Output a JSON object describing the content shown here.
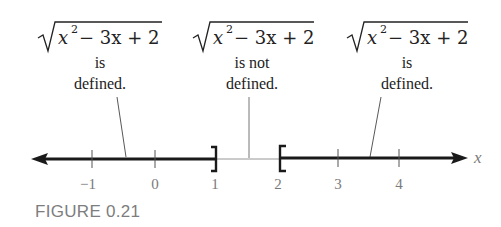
{
  "figure": {
    "caption": "FIGURE 0.21",
    "axis_variable": "x",
    "expression": {
      "radical": "√",
      "base": "x",
      "exponent": "2",
      "rest": " − 3x + 2"
    },
    "annotations": [
      {
        "line1": "is",
        "line2": "defined.",
        "region": "x ≤ 1"
      },
      {
        "line1": "is not",
        "line2": "defined.",
        "region": "1 < x < 2"
      },
      {
        "line1": "is",
        "line2": "defined.",
        "region": "x ≥ 2"
      }
    ],
    "ticks": [
      {
        "value": -1,
        "label": "−1"
      },
      {
        "value": 0,
        "label": "0"
      },
      {
        "value": 1,
        "label": "1"
      },
      {
        "value": 2,
        "label": "2"
      },
      {
        "value": 3,
        "label": "3"
      },
      {
        "value": 4,
        "label": "4"
      }
    ],
    "endpoints": [
      {
        "value": 1,
        "bracket": "]",
        "type": "closed"
      },
      {
        "value": 2,
        "bracket": "[",
        "type": "closed"
      }
    ],
    "colors": {
      "line": "#1a1a1a",
      "thin_line": "#8a8a8a",
      "tick_labels": "#7a7a7a",
      "caption": "#7d7d7d"
    }
  }
}
